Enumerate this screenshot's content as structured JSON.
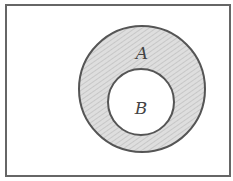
{
  "diagram": {
    "type": "venn",
    "universe": {
      "label": ""
    },
    "sets": [
      {
        "id": "A",
        "label": "A",
        "shaded": true
      },
      {
        "id": "B",
        "label": "B",
        "shaded": false,
        "subset_of": "A"
      }
    ],
    "colors": {
      "stroke": "#555555",
      "shade": "#d4d4d4",
      "background": "#ffffff"
    }
  }
}
